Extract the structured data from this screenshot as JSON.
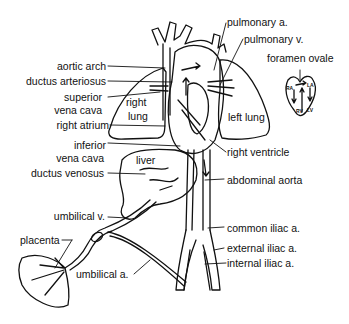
{
  "figure": {
    "labels": {
      "aortic_arch": "aortic arch",
      "ductus_arteriosus": "ductus arteriosus",
      "superior_vena_cava_1": "superior",
      "superior_vena_cava_2": "vena cava",
      "right_lung_1": "right",
      "right_lung_2": "lung",
      "right_atrium": "right atrium",
      "inferior_vena_cava_1": "inferior",
      "inferior_vena_cava_2": "vena cava",
      "liver": "liver",
      "ductus_venosus": "ductus venosus",
      "umbilical_vein": "umbilical v.",
      "placenta": "placenta",
      "umbilical_artery": "umbilical a.",
      "pulmonary_artery": "pulmonary a.",
      "pulmonary_vein": "pulmonary v.",
      "foramen_ovale": "foramen ovale",
      "left_lung": "left lung",
      "right_ventricle": "right ventricle",
      "abdominal_aorta": "abdominal aorta",
      "common_iliac": "common iliac a.",
      "external_iliac": "external iliac a.",
      "internal_iliac": "internal iliac a."
    },
    "inset": {
      "ra": "RA",
      "la": "LA",
      "rv": "RV",
      "lv": "LV"
    }
  }
}
